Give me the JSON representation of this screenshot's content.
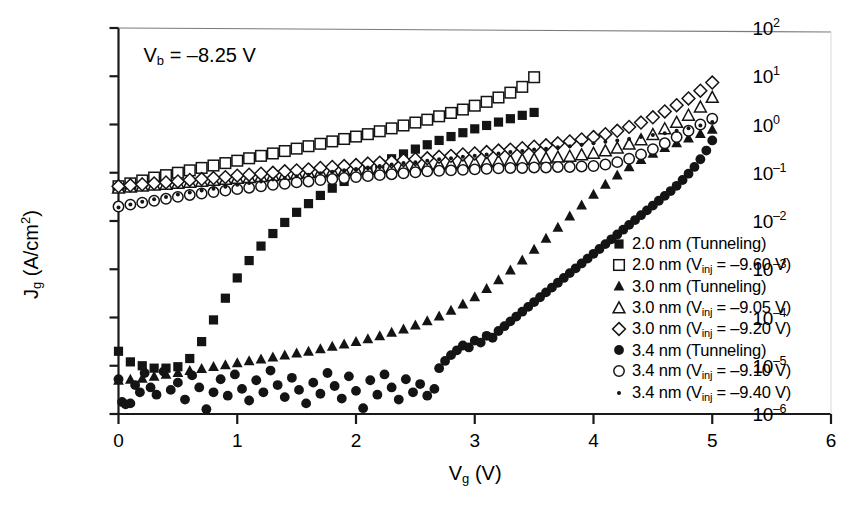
{
  "annotation": {
    "text_html": "V<sub>b</sub> = –8.25 V"
  },
  "axes": {
    "x": {
      "label_html": "V<sub>g</sub> (V)",
      "ticks": [
        "0",
        "1",
        "2",
        "3",
        "4",
        "5",
        "6"
      ],
      "min": 0,
      "max": 6
    },
    "y": {
      "label_html": "J<sub>g</sub> (A/cm<sup>2</sup>)",
      "ticks": [
        "10<sup>2</sup>",
        "10<sup>1</sup>",
        "10<sup>0</sup>",
        "10<sup>-1</sup>",
        "10<sup>-2</sup>",
        "10<sup>-3</sup>",
        "10<sup>-4</sup>",
        "10<sup>-5</sup>",
        "10<sup>-6</sup>"
      ],
      "min_exp": -6,
      "max_exp": 2
    }
  },
  "legend": {
    "entries": [
      {
        "marker": "filled-square",
        "label_html": "2.0 nm (Tunneling)"
      },
      {
        "marker": "open-square",
        "label_html": "2.0 nm (V<sub>inj</sub> = –9.60 V)"
      },
      {
        "marker": "filled-triangle",
        "label_html": "3.0 nm (Tunneling)"
      },
      {
        "marker": "open-triangle",
        "label_html": "3.0 nm (V<sub>inj</sub> = –9.05 V)"
      },
      {
        "marker": "open-diamond",
        "label_html": "3.0 nm (V<sub>inj</sub> = –9.20 V)"
      },
      {
        "marker": "filled-circle",
        "label_html": "3.4 nm (Tunneling)"
      },
      {
        "marker": "open-circle",
        "label_html": "3.4 nm (V<sub>inj</sub> = –9.10 V)"
      },
      {
        "marker": "small-dot",
        "label_html": "3.4 nm (V<sub>inj</sub> = –9.40 V)"
      }
    ]
  },
  "chart_data": {
    "type": "scatter",
    "title": "",
    "xlabel": "Vg (V)",
    "ylabel": "Jg (A/cm^2)",
    "xlim": [
      0,
      6
    ],
    "ylim_log10": [
      -6,
      2
    ],
    "yscale": "log",
    "grid": false,
    "legend_position": "right-inside",
    "annotations": [
      {
        "text": "Vb = -8.25 V",
        "x": 0.35,
        "y_log10": 1.45
      }
    ],
    "series": [
      {
        "name": "2.0 nm (Tunneling)",
        "marker": "filled-square",
        "x": [
          0.0,
          0.1,
          0.2,
          0.3,
          0.4,
          0.5,
          0.6,
          0.7,
          0.8,
          0.9,
          1.0,
          1.1,
          1.2,
          1.3,
          1.4,
          1.5,
          1.6,
          1.7,
          1.8,
          1.9,
          2.0,
          2.1,
          2.2,
          2.3,
          2.4,
          2.5,
          2.6,
          2.7,
          2.8,
          2.9,
          3.0,
          3.1,
          3.2,
          3.3,
          3.4,
          3.5
        ],
        "y_log10": [
          -4.7,
          -4.92,
          -5.0,
          -5.05,
          -5.05,
          -5.02,
          -4.85,
          -4.5,
          -4.05,
          -3.6,
          -3.18,
          -2.82,
          -2.52,
          -2.26,
          -2.03,
          -1.82,
          -1.64,
          -1.47,
          -1.32,
          -1.18,
          -1.05,
          -0.93,
          -0.82,
          -0.71,
          -0.61,
          -0.51,
          -0.42,
          -0.33,
          -0.25,
          -0.17,
          -0.09,
          -0.02,
          0.05,
          0.12,
          0.19,
          0.25
        ]
      },
      {
        "name": "2.0 nm (Vinj = -9.60 V)",
        "marker": "open-square",
        "x": [
          0.0,
          0.1,
          0.2,
          0.3,
          0.4,
          0.5,
          0.6,
          0.7,
          0.8,
          0.9,
          1.0,
          1.1,
          1.2,
          1.3,
          1.4,
          1.5,
          1.6,
          1.7,
          1.8,
          1.9,
          2.0,
          2.1,
          2.2,
          2.3,
          2.4,
          2.5,
          2.6,
          2.7,
          2.8,
          2.9,
          3.0,
          3.1,
          3.2,
          3.3,
          3.4,
          3.5
        ],
        "y_log10": [
          -1.28,
          -1.22,
          -1.16,
          -1.1,
          -1.05,
          -1.0,
          -0.95,
          -0.9,
          -0.85,
          -0.8,
          -0.75,
          -0.7,
          -0.65,
          -0.6,
          -0.55,
          -0.5,
          -0.45,
          -0.4,
          -0.35,
          -0.3,
          -0.25,
          -0.2,
          -0.14,
          -0.08,
          -0.02,
          0.04,
          0.1,
          0.17,
          0.24,
          0.31,
          0.39,
          0.47,
          0.56,
          0.66,
          0.78,
          0.98
        ]
      },
      {
        "name": "3.0 nm (Tunneling)",
        "marker": "filled-triangle",
        "x": [
          0.0,
          0.1,
          0.2,
          0.3,
          0.4,
          0.5,
          0.6,
          0.7,
          0.8,
          0.9,
          1.0,
          1.1,
          1.2,
          1.3,
          1.4,
          1.5,
          1.6,
          1.7,
          1.8,
          1.9,
          2.0,
          2.1,
          2.2,
          2.3,
          2.4,
          2.5,
          2.6,
          2.7,
          2.8,
          2.9,
          3.0,
          3.1,
          3.2,
          3.3,
          3.4,
          3.5,
          3.6,
          3.7,
          3.8,
          3.9,
          4.0,
          4.1,
          4.2,
          4.3,
          4.4,
          4.5,
          4.6,
          4.7,
          4.8,
          4.9,
          5.0
        ],
        "y_log10": [
          -5.3,
          -5.28,
          -5.26,
          -5.22,
          -5.18,
          -5.14,
          -5.1,
          -5.06,
          -5.02,
          -4.98,
          -4.94,
          -4.9,
          -4.86,
          -4.82,
          -4.78,
          -4.74,
          -4.7,
          -4.65,
          -4.6,
          -4.55,
          -4.5,
          -4.44,
          -4.38,
          -4.31,
          -4.24,
          -4.16,
          -4.07,
          -3.97,
          -3.85,
          -3.72,
          -3.57,
          -3.4,
          -3.22,
          -3.02,
          -2.81,
          -2.59,
          -2.36,
          -2.13,
          -1.9,
          -1.67,
          -1.45,
          -1.24,
          -1.05,
          -0.88,
          -0.73,
          -0.6,
          -0.48,
          -0.38,
          -0.28,
          -0.19,
          -0.1
        ]
      },
      {
        "name": "3.0 nm (Vinj = -9.05 V)",
        "marker": "open-triangle",
        "x": [
          0.0,
          0.1,
          0.2,
          0.3,
          0.4,
          0.5,
          0.6,
          0.7,
          0.8,
          0.9,
          1.0,
          1.1,
          1.2,
          1.3,
          1.4,
          1.5,
          1.6,
          1.7,
          1.8,
          1.9,
          2.0,
          2.1,
          2.2,
          2.3,
          2.4,
          2.5,
          2.6,
          2.7,
          2.8,
          2.9,
          3.0,
          3.1,
          3.2,
          3.3,
          3.4,
          3.5,
          3.6,
          3.7,
          3.8,
          3.9,
          4.0,
          4.1,
          4.2,
          4.3,
          4.4,
          4.5,
          4.6,
          4.7,
          4.8,
          4.9,
          5.0
        ],
        "y_log10": [
          -1.32,
          -1.3,
          -1.28,
          -1.26,
          -1.24,
          -1.22,
          -1.2,
          -1.18,
          -1.16,
          -1.14,
          -1.12,
          -1.1,
          -1.08,
          -1.06,
          -1.04,
          -1.02,
          -1.0,
          -0.99,
          -0.97,
          -0.96,
          -0.94,
          -0.93,
          -0.91,
          -0.9,
          -0.88,
          -0.87,
          -0.85,
          -0.84,
          -0.82,
          -0.81,
          -0.79,
          -0.78,
          -0.76,
          -0.75,
          -0.73,
          -0.72,
          -0.7,
          -0.68,
          -0.66,
          -0.63,
          -0.6,
          -0.55,
          -0.49,
          -0.41,
          -0.32,
          -0.21,
          -0.09,
          0.04,
          0.19,
          0.36,
          0.56
        ]
      },
      {
        "name": "3.0 nm (Vinj = -9.20 V)",
        "marker": "open-diamond",
        "x": [
          0.0,
          0.1,
          0.2,
          0.3,
          0.4,
          0.5,
          0.6,
          0.7,
          0.8,
          0.9,
          1.0,
          1.1,
          1.2,
          1.3,
          1.4,
          1.5,
          1.6,
          1.7,
          1.8,
          1.9,
          2.0,
          2.1,
          2.2,
          2.3,
          2.4,
          2.5,
          2.6,
          2.7,
          2.8,
          2.9,
          3.0,
          3.1,
          3.2,
          3.3,
          3.4,
          3.5,
          3.6,
          3.7,
          3.8,
          3.9,
          4.0,
          4.1,
          4.2,
          4.3,
          4.4,
          4.5,
          4.6,
          4.7,
          4.8,
          4.9,
          5.0
        ],
        "y_log10": [
          -1.28,
          -1.26,
          -1.24,
          -1.22,
          -1.2,
          -1.18,
          -1.15,
          -1.13,
          -1.11,
          -1.09,
          -1.06,
          -1.04,
          -1.02,
          -1.0,
          -0.97,
          -0.95,
          -0.93,
          -0.9,
          -0.88,
          -0.86,
          -0.84,
          -0.81,
          -0.79,
          -0.77,
          -0.74,
          -0.72,
          -0.7,
          -0.67,
          -0.65,
          -0.62,
          -0.6,
          -0.57,
          -0.54,
          -0.52,
          -0.49,
          -0.46,
          -0.43,
          -0.39,
          -0.35,
          -0.31,
          -0.26,
          -0.2,
          -0.13,
          -0.05,
          0.04,
          0.15,
          0.27,
          0.4,
          0.54,
          0.7,
          0.87
        ]
      },
      {
        "name": "3.4 nm (Tunneling)",
        "marker": "filled-circle",
        "x": [
          0.0,
          0.03,
          0.06,
          0.1,
          0.14,
          0.18,
          0.22,
          0.27,
          0.32,
          0.38,
          0.44,
          0.5,
          0.56,
          0.62,
          0.68,
          0.74,
          0.8,
          0.86,
          0.92,
          0.98,
          1.04,
          1.1,
          1.16,
          1.22,
          1.28,
          1.34,
          1.4,
          1.46,
          1.52,
          1.58,
          1.64,
          1.7,
          1.76,
          1.82,
          1.88,
          1.94,
          2.0,
          2.06,
          2.12,
          2.18,
          2.24,
          2.3,
          2.36,
          2.42,
          2.48,
          2.54,
          2.6,
          2.66,
          2.7,
          2.75,
          2.8,
          2.85,
          2.9,
          2.95,
          3.0,
          3.05,
          3.1,
          3.15,
          3.2,
          3.25,
          3.3,
          3.35,
          3.4,
          3.45,
          3.5,
          3.55,
          3.6,
          3.65,
          3.7,
          3.75,
          3.8,
          3.85,
          3.9,
          3.95,
          4.0,
          4.05,
          4.1,
          4.15,
          4.2,
          4.25,
          4.3,
          4.35,
          4.4,
          4.45,
          4.5,
          4.55,
          4.6,
          4.65,
          4.7,
          4.75,
          4.8,
          4.85,
          4.9,
          4.95,
          5.0
        ],
        "y_log10": [
          -5.28,
          -5.75,
          -5.8,
          -5.78,
          -5.4,
          -5.55,
          -5.15,
          -5.45,
          -5.6,
          -5.12,
          -5.5,
          -5.35,
          -5.7,
          -5.2,
          -5.45,
          -5.9,
          -5.55,
          -5.28,
          -5.62,
          -5.18,
          -5.48,
          -5.72,
          -5.3,
          -5.55,
          -5.1,
          -5.4,
          -5.65,
          -5.25,
          -5.5,
          -5.78,
          -5.35,
          -5.58,
          -5.15,
          -5.42,
          -5.68,
          -5.22,
          -5.52,
          -5.88,
          -5.3,
          -5.6,
          -5.18,
          -5.45,
          -5.7,
          -5.28,
          -5.55,
          -5.38,
          -5.62,
          -5.48,
          -5.05,
          -4.9,
          -4.78,
          -4.68,
          -4.58,
          -4.62,
          -4.48,
          -4.52,
          -4.38,
          -4.42,
          -4.28,
          -4.18,
          -4.08,
          -3.98,
          -3.88,
          -3.78,
          -3.68,
          -3.58,
          -3.48,
          -3.38,
          -3.28,
          -3.18,
          -3.08,
          -2.98,
          -2.88,
          -2.78,
          -2.68,
          -2.58,
          -2.48,
          -2.38,
          -2.28,
          -2.18,
          -2.08,
          -1.98,
          -1.88,
          -1.78,
          -1.68,
          -1.58,
          -1.48,
          -1.38,
          -1.27,
          -1.15,
          -1.02,
          -0.88,
          -0.72,
          -0.54,
          -0.33
        ]
      },
      {
        "name": "3.4 nm (Vinj = -9.10 V)",
        "marker": "open-circle",
        "x": [
          0.0,
          0.1,
          0.2,
          0.3,
          0.4,
          0.5,
          0.6,
          0.7,
          0.8,
          0.9,
          1.0,
          1.1,
          1.2,
          1.3,
          1.4,
          1.5,
          1.6,
          1.7,
          1.8,
          1.9,
          2.0,
          2.1,
          2.2,
          2.3,
          2.4,
          2.5,
          2.6,
          2.7,
          2.8,
          2.9,
          3.0,
          3.1,
          3.2,
          3.3,
          3.4,
          3.5,
          3.6,
          3.7,
          3.8,
          3.9,
          4.0,
          4.1,
          4.2,
          4.3,
          4.4,
          4.5,
          4.6,
          4.7,
          4.8,
          4.9,
          5.0
        ],
        "y_log10": [
          -1.7,
          -1.66,
          -1.62,
          -1.58,
          -1.54,
          -1.5,
          -1.46,
          -1.43,
          -1.4,
          -1.37,
          -1.34,
          -1.31,
          -1.28,
          -1.25,
          -1.23,
          -1.2,
          -1.18,
          -1.15,
          -1.13,
          -1.11,
          -1.09,
          -1.07,
          -1.05,
          -1.03,
          -1.01,
          -0.99,
          -0.97,
          -0.96,
          -0.95,
          -0.94,
          -0.93,
          -0.92,
          -0.91,
          -0.9,
          -0.9,
          -0.89,
          -0.89,
          -0.88,
          -0.88,
          -0.87,
          -0.86,
          -0.83,
          -0.78,
          -0.71,
          -0.62,
          -0.51,
          -0.39,
          -0.26,
          -0.13,
          0.0,
          0.12
        ]
      },
      {
        "name": "3.4 nm (Vinj = -9.40 V)",
        "marker": "small-dot",
        "x": [
          0.0,
          0.1,
          0.2,
          0.3,
          0.4,
          0.5,
          0.6,
          0.7,
          0.8,
          0.9,
          1.0,
          1.1,
          1.2,
          1.3,
          1.4,
          1.5,
          1.6,
          1.7,
          1.8,
          1.9,
          2.0,
          2.1,
          2.2,
          2.3,
          2.4,
          2.5,
          2.6,
          2.7,
          2.8,
          2.9,
          3.0,
          3.1,
          3.2,
          3.3,
          3.4,
          3.5,
          3.6,
          3.7,
          3.8,
          3.9,
          4.0,
          4.1,
          4.2,
          4.3,
          4.4,
          4.5,
          4.6,
          4.7,
          4.8,
          4.9,
          5.0
        ],
        "y_log10": [
          -1.72,
          -1.66,
          -1.6,
          -1.55,
          -1.5,
          -1.45,
          -1.41,
          -1.37,
          -1.33,
          -1.29,
          -1.25,
          -1.21,
          -1.18,
          -1.14,
          -1.11,
          -1.07,
          -1.04,
          -1.01,
          -0.98,
          -0.95,
          -0.92,
          -0.89,
          -0.86,
          -0.83,
          -0.8,
          -0.78,
          -0.75,
          -0.72,
          -0.7,
          -0.67,
          -0.65,
          -0.62,
          -0.6,
          -0.57,
          -0.55,
          -0.52,
          -0.5,
          -0.47,
          -0.45,
          -0.42,
          -0.39,
          -0.36,
          -0.33,
          -0.3,
          -0.26,
          -0.22,
          -0.18,
          -0.13,
          -0.08,
          -0.02,
          0.05
        ]
      }
    ]
  }
}
